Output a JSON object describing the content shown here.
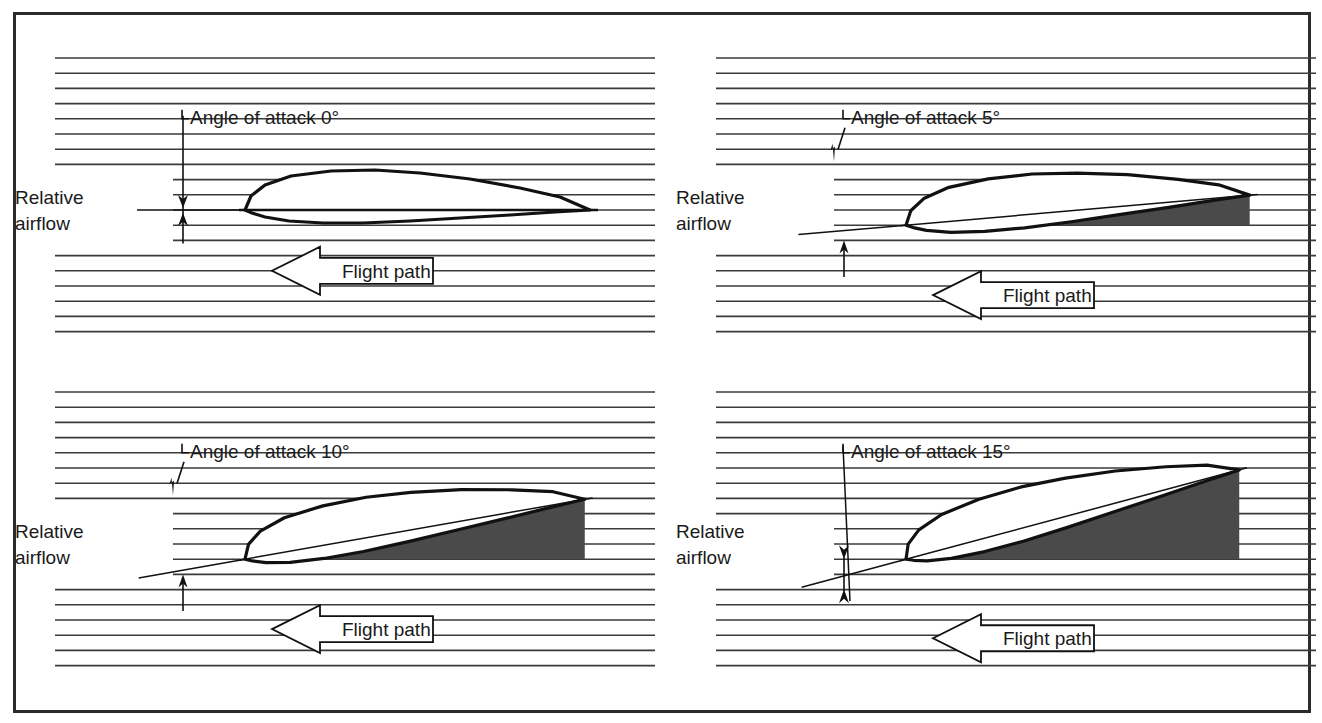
{
  "figure": {
    "border_color": "#2b2b2b",
    "background_color": "#ffffff",
    "streamline_color": "#3a3a3a",
    "shade_color": "#4a4a4a",
    "ink_color": "#111111"
  },
  "panels": [
    {
      "id": "aoa-0",
      "angle_label": "Angle of attack 0°",
      "relative_airflow_label_line1": "Relative",
      "relative_airflow_label_line2": "airflow",
      "flight_path_label": "Flight path",
      "angle_degrees": 0,
      "shaded": false,
      "arrow_style": "double",
      "column": 0,
      "row": 0
    },
    {
      "id": "aoa-5",
      "angle_label": "Angle of attack 5°",
      "relative_airflow_label_line1": "Relative",
      "relative_airflow_label_line2": "airflow",
      "flight_path_label": "Flight path",
      "angle_degrees": 5,
      "shaded": true,
      "arrow_style": "single-up",
      "column": 1,
      "row": 0
    },
    {
      "id": "aoa-10",
      "angle_label": "Angle of attack 10°",
      "relative_airflow_label_line1": "Relative",
      "relative_airflow_label_line2": "airflow",
      "flight_path_label": "Flight path",
      "angle_degrees": 10,
      "shaded": true,
      "arrow_style": "single-up",
      "column": 0,
      "row": 1
    },
    {
      "id": "aoa-15",
      "angle_label": "Angle of attack 15°",
      "relative_airflow_label_line1": "Relative",
      "relative_airflow_label_line2": "airflow",
      "flight_path_label": "Flight path",
      "angle_degrees": 15,
      "shaded": true,
      "arrow_style": "double",
      "column": 1,
      "row": 1
    }
  ],
  "chart_data": {
    "type": "diagram",
    "categories": [
      "0°",
      "5°",
      "10°",
      "15°"
    ],
    "values": [
      0,
      5,
      10,
      15
    ],
    "xlabel": "",
    "ylabel": "Angle of attack (degrees)",
    "legend": [
      "Relative airflow",
      "Flight path",
      "Angle of attack"
    ]
  }
}
